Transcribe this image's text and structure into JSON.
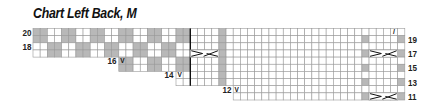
{
  "title": "Chart Left Back, M",
  "chart_data": {
    "type": "knitting-chart",
    "title": "Chart Left Back, M",
    "columns": 52,
    "rows_top_to_bottom": [
      20,
      19,
      18,
      17,
      16,
      15,
      14,
      13,
      12,
      11
    ],
    "left_row_labels": [
      {
        "row": 20,
        "label": "20"
      },
      {
        "row": 18,
        "label": "18"
      }
    ],
    "step_row_labels": [
      {
        "row": 16,
        "label": "16",
        "symbol": "V"
      },
      {
        "row": 14,
        "label": "14",
        "symbol": "V"
      },
      {
        "row": 12,
        "label": "12",
        "symbol": "V"
      }
    ],
    "right_row_labels": [
      {
        "row": 19,
        "label": "19"
      },
      {
        "row": 17,
        "label": "17"
      },
      {
        "row": 15,
        "label": "15"
      },
      {
        "row": 13,
        "label": "13"
      },
      {
        "row": 11,
        "label": "11"
      }
    ],
    "row_start_col": {
      "20": 0,
      "19": 0,
      "18": 0,
      "17": 0,
      "16": 12,
      "15": 12,
      "14": 20,
      "13": 20,
      "12": 28,
      "11": 28
    },
    "checker_section": {
      "end_col": 21,
      "block_cols": 2,
      "period": 4,
      "row_pair_offsets": {
        "20": 0,
        "19": 0,
        "18": 2,
        "17": 2,
        "16": 0,
        "15": 0,
        "14": 2,
        "13": 2
      }
    },
    "divider_after_col": 21,
    "divider_rows": [
      20,
      13
    ],
    "shaded_column_full": {
      "col": 26,
      "rows": [
        20,
        19,
        18,
        17,
        16,
        15,
        14,
        13
      ]
    },
    "shaded_columns_odd_rows": {
      "cols": [
        46,
        51
      ],
      "rows": [
        19,
        17,
        15,
        13,
        11
      ]
    },
    "cables": [
      {
        "row": 17,
        "cols": [
          22,
          25
        ]
      },
      {
        "row": 17,
        "cols": [
          47,
          50
        ]
      },
      {
        "row": 11,
        "cols": [
          47,
          50
        ]
      }
    ],
    "symbols": [
      {
        "row": 16,
        "col": 12,
        "glyph": "V"
      },
      {
        "row": 14,
        "col": 20,
        "glyph": "V"
      },
      {
        "row": 12,
        "col": 28,
        "glyph": "V"
      },
      {
        "row": 20,
        "col": 50,
        "glyph": "/"
      }
    ],
    "colors": {
      "shade": "#b8b8b8",
      "grid": "#9a9a9a",
      "line": "#111111"
    }
  }
}
